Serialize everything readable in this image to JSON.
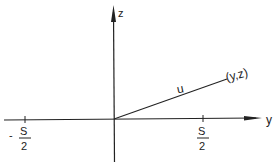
{
  "diagram": {
    "type": "coordinate-axes-vector",
    "axes": {
      "horizontal": {
        "label": "y"
      },
      "vertical": {
        "label": "z"
      }
    },
    "vector": {
      "label": "u",
      "endpoint_label": "(y,z)"
    },
    "ticks": [
      {
        "sign": "-",
        "numerator": "S",
        "denominator": "2"
      },
      {
        "sign": "",
        "numerator": "S",
        "denominator": "2"
      }
    ],
    "colors": {
      "ink": "#222222",
      "background": "#ffffff"
    }
  }
}
